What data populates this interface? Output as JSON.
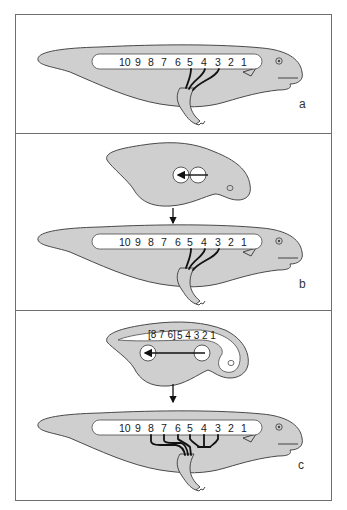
{
  "figure": {
    "colors": {
      "body_fill": "#cfcfcf",
      "outline": "#4a4a4a",
      "nerve": "#111111",
      "frame": "#6f6f6f",
      "background": "#ffffff"
    },
    "panels": [
      {
        "id": "a",
        "label": "a",
        "segments": [
          "10",
          "9",
          "8",
          "7",
          "6",
          "5",
          "4",
          "3",
          "2",
          "1"
        ],
        "nerve_segments": [
          "5",
          "4",
          "3"
        ]
      },
      {
        "id": "b",
        "label": "b",
        "embryo": {
          "transplant": "arrow between two white discs, pointing posterior (left)"
        },
        "segments": [
          "10",
          "9",
          "8",
          "7",
          "6",
          "5",
          "4",
          "3",
          "2",
          "1"
        ],
        "nerve_segments": [
          "5",
          "4",
          "3"
        ]
      },
      {
        "id": "c",
        "label": "c",
        "embryo": {
          "segment_label_bracket": "[8 7 6]",
          "segment_label_rest": "5 4 3 2 1",
          "transplant": "long arrow between two white discs, pointing posterior (left)"
        },
        "segments": [
          "10",
          "9",
          "8",
          "7",
          "6",
          "5",
          "4",
          "3",
          "2",
          "1"
        ],
        "nerve_segments": [
          "8",
          "7",
          "6",
          "5",
          "4",
          "3"
        ]
      }
    ]
  }
}
